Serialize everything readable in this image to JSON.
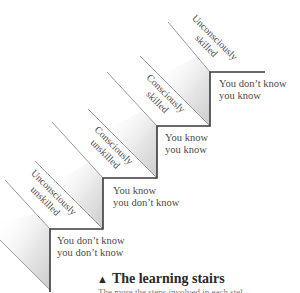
{
  "diagram": {
    "type": "staircase",
    "title": "The learning stairs",
    "title_marker": "▲",
    "subcaption_partial": "The more the steps involved in each stel",
    "steps": [
      {
        "stage": "Unconsciously\nunskilled",
        "stage_lines": [
          "Unconsciously",
          "unskilled"
        ],
        "state_lines": [
          "You don’t know",
          "you don’t know"
        ]
      },
      {
        "stage": "Consciously\nunskilled",
        "stage_lines": [
          "Consciously",
          "unskilled"
        ],
        "state_lines": [
          "You know",
          "you don’t know"
        ]
      },
      {
        "stage": "Consciously\nskilled",
        "stage_lines": [
          "Consciously",
          "skilled"
        ],
        "state_lines": [
          "You know",
          "you know"
        ]
      },
      {
        "stage": "Unconsciously\nskilled",
        "stage_lines": [
          "Unconsciously",
          "skilled"
        ],
        "state_lines": [
          "You don’t know",
          "you know"
        ]
      }
    ],
    "colors": {
      "line": "#3a3a3a",
      "shade": "#d9d9d9",
      "text": "#4a4a4a"
    }
  }
}
